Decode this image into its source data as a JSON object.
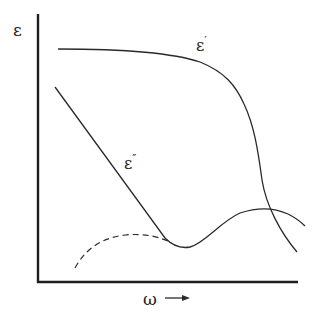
{
  "diagram": {
    "y_axis_label": "ε",
    "x_axis_label": "ω",
    "x_axis_arrow": "→",
    "curves": [
      {
        "name": "epsilon-prime",
        "symbol": "ε",
        "prime": "′",
        "style": "solid"
      },
      {
        "name": "epsilon-double-prime",
        "symbol": "ε",
        "prime": "″",
        "style": "solid with dashed extension"
      }
    ],
    "colors": {
      "line": "#2a2a2a",
      "background": "#ffffff"
    }
  }
}
